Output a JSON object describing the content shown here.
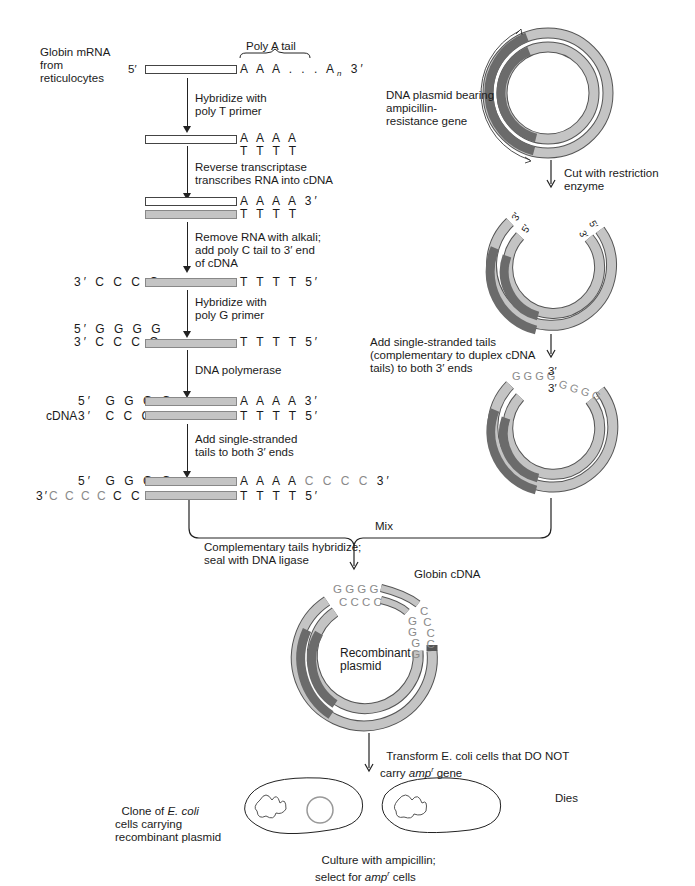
{
  "left_column": {
    "start_label": "Globin mRNA\nfrom\nreticulocytes",
    "poly_a_label": "Poly A tail",
    "row1": {
      "left": "5′",
      "right": "A A A . . . A",
      "sub": "n",
      "end": " 3′"
    },
    "step1": "Hybridize with\npoly T primer",
    "row2": {
      "right_top": "A A A A",
      "right_bot": "T T T T"
    },
    "step2": "Reverse transcriptase\ntranscribes RNA into cDNA",
    "row3": {
      "right_top": "A A A A 3′",
      "right_bot": "T T T T"
    },
    "step3": "Remove RNA with alkali;\nadd poly C tail to 3′ end\nof cDNA",
    "row4": {
      "left": "3′ C C C C",
      "right": "T T T T 5′"
    },
    "step4": "Hybridize with\npoly G primer",
    "row5": {
      "left_top": "5′ G G G G",
      "left_bot": "3′ C C C C",
      "right": "T T T T 5′"
    },
    "step5": "DNA polymerase",
    "row6": {
      "left_top": "5′  G G G G",
      "cdna_label": "cDNA",
      "left_bot": "3′  C C C C",
      "right_top": "A A A A 3′",
      "right_bot": "T T T T 5′"
    },
    "step6": "Add single-stranded\ntails to both 3′ ends",
    "row7": {
      "left_top": "5′  G G G G",
      "left_bot_prefix": "3′",
      "left_bot_light": "C C C C ",
      "left_bot": "C C C C",
      "right_top": "A A A A ",
      "right_top_light": "C C C C",
      "right_top_end": " 3′",
      "right_bot": "T T T T 5′"
    }
  },
  "right_column": {
    "plasmid_label": "DNA plasmid bearing\nampicillin-\nresistance gene",
    "cut_step": "Cut with restriction\nenzyme",
    "cut_end_labels": [
      "3′",
      "5′",
      "3′",
      "5′"
    ],
    "tails_step": "Add single-stranded tails\n(complementary to duplex cDNA\ntails) to both 3′ ends",
    "tail_top": "G G G G",
    "tail_top_end": "3′",
    "tail_bot_start": "3′",
    "tail_bot": "G G G G"
  },
  "merge": {
    "mix_label": "Mix",
    "hybridize_step": "Complementary tails hybridize;\nseal with DNA ligase",
    "globin_cdna_label": "Globin cDNA",
    "recombinant_label": "Recombinant\nplasmid",
    "tail_letters_outer": "G G G G",
    "tail_letters_inner": "C C C C"
  },
  "bottom": {
    "transform_step_a": "Transform E. coli cells that DO NOT",
    "transform_step_b": "carry ",
    "transform_gene": "amp",
    "transform_sup": "r",
    "transform_step_c": " gene",
    "clone_label_a": "Clone of ",
    "clone_label_italic": "E. coli",
    "clone_label_b": "cells carrying\nrecombinant plasmid",
    "dies_label": "Dies",
    "culture_step_a": "Culture with ampicillin;",
    "culture_step_b": "select for ",
    "culture_gene": "amp",
    "culture_sup": "r",
    "culture_step_c": " cells"
  },
  "colors": {
    "dna_light": "#c4c4c4",
    "amp_gene_dark": "#6b6b6b",
    "tail_letters": "#8a8a8a",
    "line": "#222222"
  }
}
